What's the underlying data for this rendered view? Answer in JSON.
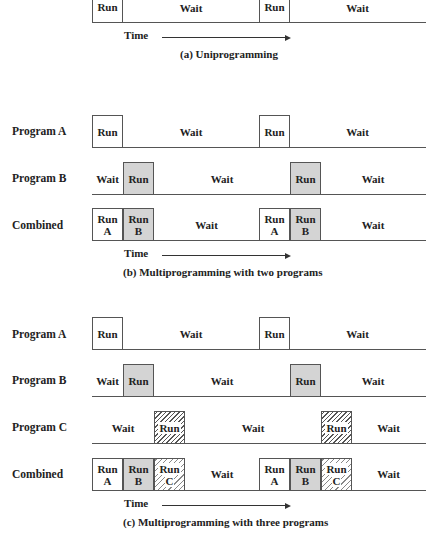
{
  "section_a": {
    "boxes": [
      "Run",
      "Run"
    ],
    "waits": [
      "Wait",
      "Wait"
    ],
    "time_label": "Time",
    "caption": "(a) Uniprogramming"
  },
  "section_b": {
    "program_a": {
      "label": "Program A",
      "run": "Run",
      "waits": [
        "Wait",
        "Wait"
      ]
    },
    "program_b": {
      "label": "Program B",
      "run": "Run",
      "waits": [
        "Wait",
        "Wait",
        "Wait"
      ]
    },
    "combined": {
      "label": "Combined",
      "run_a": [
        "Run",
        "A"
      ],
      "run_b": [
        "Run",
        "B"
      ],
      "waits": [
        "Wait",
        "Wait"
      ]
    },
    "time_label": "Time",
    "caption": "(b) Multiprogramming with two programs"
  },
  "section_c": {
    "program_a": {
      "label": "Program A",
      "run": "Run",
      "waits": [
        "Wait",
        "Wait"
      ]
    },
    "program_b": {
      "label": "Program B",
      "run": "Run",
      "waits": [
        "Wait",
        "Wait",
        "Wait"
      ]
    },
    "program_c": {
      "label": "Program C",
      "run": "Run",
      "waits": [
        "Wait",
        "Wait",
        "Wait"
      ]
    },
    "combined": {
      "label": "Combined",
      "run_a": [
        "Run",
        "A"
      ],
      "run_b": [
        "Run",
        "B"
      ],
      "run_c": [
        "Run",
        "C"
      ],
      "waits": [
        "Wait",
        "Wait"
      ]
    },
    "time_label": "Time",
    "caption": "(c) Multiprogramming with three programs"
  },
  "colors": {
    "line": "#555555",
    "gray_fill": "#d4d4d4",
    "hatch": "#555555",
    "text": "#222222"
  }
}
